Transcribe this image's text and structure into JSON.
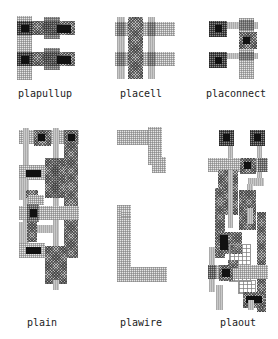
{
  "figure": {
    "type": "vlsi-layout-cell-gallery",
    "cells": [
      {
        "id": "plapullup",
        "label": "plapullup"
      },
      {
        "id": "placell",
        "label": "placell"
      },
      {
        "id": "placonnect",
        "label": "placonnect"
      },
      {
        "id": "plain",
        "label": "plain"
      },
      {
        "id": "plawire",
        "label": "plawire"
      },
      {
        "id": "plaout",
        "label": "plaout"
      }
    ],
    "layers": [
      {
        "name": "poly",
        "pattern": "light-stripe",
        "color": "#c9c9c9"
      },
      {
        "name": "wire",
        "pattern": "light-grid",
        "color": "#e6e6e6"
      },
      {
        "name": "metal",
        "pattern": "checker",
        "color": "#b8b8b8"
      },
      {
        "name": "overlap",
        "pattern": "dark-crosshatch",
        "color": "#8d8d8d"
      },
      {
        "name": "contact",
        "pattern": "solid",
        "color": "#111111"
      }
    ]
  }
}
